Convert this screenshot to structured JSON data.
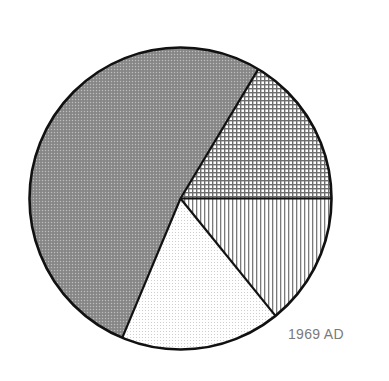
{
  "caption": "1969 AD",
  "chart_data": {
    "type": "pie",
    "title": "",
    "caption": "1969 AD",
    "legend": [],
    "start_angle_deg": 0,
    "direction": "clockwise",
    "slices": [
      {
        "name": "vertical-line-hatched segment",
        "pattern": "vertical-lines",
        "share_pct": 14.2,
        "angle_deg": 51.0
      },
      {
        "name": "light stippled segment",
        "pattern": "light-dots",
        "share_pct": 17.1,
        "angle_deg": 61.7
      },
      {
        "name": "dark gray stippled segment",
        "pattern": "dark-checker",
        "share_pct": 52.3,
        "angle_deg": 188.3
      },
      {
        "name": "cross-hatched grid segment",
        "pattern": "grid",
        "share_pct": 16.4,
        "angle_deg": 59.0
      }
    ],
    "values": [
      14.2,
      17.1,
      52.3,
      16.4
    ],
    "categories": [
      "vertical-lines",
      "light-dots",
      "dark-checker",
      "grid"
    ]
  },
  "geometry": {
    "cx": 180.5,
    "cy": 198.5,
    "r": 151
  },
  "colors": {
    "outline": "#111111",
    "dark_fill": "#8a8a8a",
    "pattern_line": "#6e6e6e",
    "light_dot": "#c8c8c8",
    "caption": "#7a7a7a",
    "background": "#ffffff"
  }
}
